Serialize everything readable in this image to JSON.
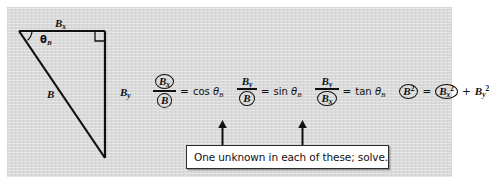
{
  "figure": {
    "labels": {
      "adjacent": "B",
      "adjacent_sub": "x",
      "hypotenuse": "B",
      "opposite": "B",
      "opposite_sub": "y",
      "angle": "θ",
      "angle_sub": "B"
    }
  },
  "equations": [
    {
      "id": "cosine-equation",
      "numerator": "B",
      "numerator_sub": "x",
      "numerator_circled": true,
      "denominator": "B",
      "denominator_sub": "",
      "denominator_circled": true,
      "operator": "=",
      "rhs_func": "cos",
      "rhs_angle": "θ",
      "rhs_angle_sub": "B"
    },
    {
      "id": "sine-equation",
      "numerator": "B",
      "numerator_sub": "y",
      "numerator_circled": false,
      "denominator": "B",
      "denominator_sub": "",
      "denominator_circled": true,
      "operator": "=",
      "rhs_func": "sin",
      "rhs_angle": "θ",
      "rhs_angle_sub": "B"
    },
    {
      "id": "tangent-equation",
      "numerator": "B",
      "numerator_sub": "y",
      "numerator_circled": false,
      "denominator": "B",
      "denominator_sub": "x",
      "denominator_circled": true,
      "operator": "=",
      "rhs_func": "tan",
      "rhs_angle": "θ",
      "rhs_angle_sub": "B"
    }
  ],
  "pythagorean": {
    "id": "pythagorean-equation",
    "lhs": "B",
    "lhs_sup": "2",
    "lhs_circled": true,
    "operator": "=",
    "term1": "B",
    "term1_sub": "x",
    "term1_sup": "2",
    "term1_circled": true,
    "plus": "+",
    "term2": "B",
    "term2_sub": "y",
    "term2_sup": "2",
    "term2_circled": false
  },
  "callout": {
    "text": "One unknown in each of these; solve.",
    "arrow_count": 2
  },
  "colors": {
    "panel_background": "#d9d9d9",
    "ink": "#111111",
    "callout_background": "#ffffff",
    "callout_border": "#2b2b2b",
    "page_background": "#ffffff"
  }
}
